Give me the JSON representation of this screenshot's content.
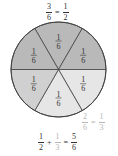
{
  "diagram": {
    "sectors": [
      {
        "label_num": "1",
        "label_den": "6",
        "position": "top",
        "shade": "dark",
        "color": "#b9b9b9"
      },
      {
        "label_num": "1",
        "label_den": "6",
        "position": "upper-right",
        "shade": "dark",
        "color": "#b9b9b9"
      },
      {
        "label_num": "1",
        "label_den": "6",
        "position": "lower-right",
        "shade": "light",
        "color": "#e6e6e6"
      },
      {
        "label_num": "1",
        "label_den": "6",
        "position": "bottom",
        "shade": "light",
        "color": "#e6e6e6"
      },
      {
        "label_num": "1",
        "label_den": "6",
        "position": "lower-left",
        "shade": "medium",
        "color": "#d0d0d0"
      },
      {
        "label_num": "1",
        "label_den": "6",
        "position": "upper-left",
        "shade": "dark",
        "color": "#b9b9b9"
      }
    ],
    "stroke_color": "#444444"
  },
  "equations": {
    "top": {
      "lhs_num": "3",
      "lhs_den": "6",
      "op": "=",
      "rhs_num": "1",
      "rhs_den": "2"
    },
    "side": {
      "lhs_num": "2",
      "lhs_den": "6",
      "op": "=",
      "rhs_num": "1",
      "rhs_den": "3"
    },
    "bottom": {
      "a_num": "1",
      "a_den": "2",
      "plus": "+",
      "b_num": "1",
      "b_den": "3",
      "eq": "=",
      "c_num": "5",
      "c_den": "6"
    }
  }
}
